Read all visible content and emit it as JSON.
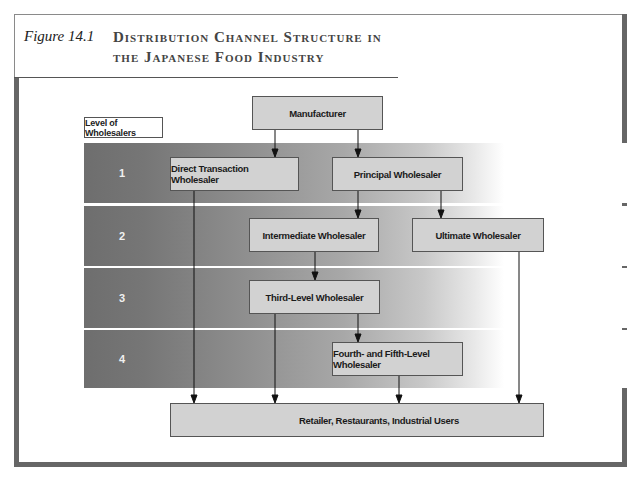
{
  "figure": {
    "label": "Figure 14.1",
    "title_line1": "Distribution Channel Structure in",
    "title_line2": "the Japanese Food Industry"
  },
  "legend": {
    "level_label": "Level of Wholesalers"
  },
  "levels": [
    "1",
    "2",
    "3",
    "4"
  ],
  "nodes": {
    "manufacturer": "Manufacturer",
    "direct_transaction": "Direct Transaction Wholesaler",
    "principal": "Principal Wholesaler",
    "intermediate": "Intermediate Wholesaler",
    "ultimate": "Ultimate Wholesaler",
    "third_level": "Third-Level Wholesaler",
    "fourth_fifth": "Fourth- and Fifth-Level Wholesaler",
    "retail": "Retailer, Restaurants, Industrial Users"
  },
  "edges": [
    {
      "from": "Manufacturer",
      "to": "Direct Transaction Wholesaler"
    },
    {
      "from": "Manufacturer",
      "to": "Principal Wholesaler"
    },
    {
      "from": "Principal Wholesaler",
      "to": "Intermediate Wholesaler"
    },
    {
      "from": "Principal Wholesaler",
      "to": "Ultimate Wholesaler"
    },
    {
      "from": "Intermediate Wholesaler",
      "to": "Third-Level Wholesaler"
    },
    {
      "from": "Third-Level Wholesaler",
      "to": "Fourth- and Fifth-Level Wholesaler"
    },
    {
      "from": "Direct Transaction Wholesaler",
      "to": "Retailer, Restaurants, Industrial Users"
    },
    {
      "from": "Third-Level Wholesaler",
      "to": "Retailer, Restaurants, Industrial Users"
    },
    {
      "from": "Fourth- and Fifth-Level Wholesaler",
      "to": "Retailer, Restaurants, Industrial Users"
    },
    {
      "from": "Ultimate Wholesaler",
      "to": "Retailer, Restaurants, Industrial Users"
    }
  ],
  "colors": {
    "frame": "#666666",
    "box_fill": "#d2d2d2",
    "band_dark": "#6e6e6e"
  }
}
